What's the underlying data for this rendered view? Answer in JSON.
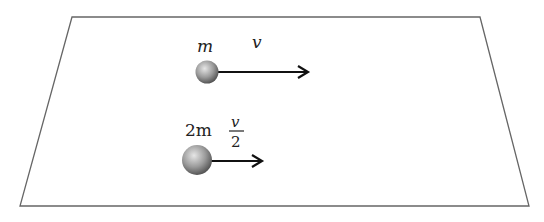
{
  "diagram": {
    "surface": {
      "shape": "parallelogram"
    },
    "balls": [
      {
        "mass_label": "m",
        "velocity_label": "v"
      },
      {
        "mass_label": "2m",
        "velocity_label_numerator": "v",
        "velocity_label_denominator": "2"
      }
    ]
  },
  "colors": {
    "outline": "#666666",
    "arrow": "#111111",
    "ball_light": "#e0e0e0",
    "ball_dark": "#555555"
  }
}
